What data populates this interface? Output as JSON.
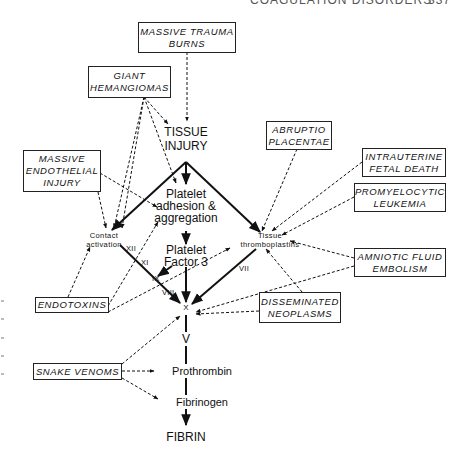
{
  "header": {
    "running_title": "COAGULATION DISORDERS",
    "page_number": "337"
  },
  "diagram": {
    "causes": [
      {
        "id": "trauma",
        "lines": [
          "MASSIVE TRAUMA",
          "BURNS"
        ],
        "targets": [
          "tissue_injury"
        ]
      },
      {
        "id": "hemangiomas",
        "lines": [
          "GIANT",
          "HEMANGIOMAS"
        ],
        "targets": [
          "tissue_injury",
          "platelet_adhesion",
          "contact_activation"
        ]
      },
      {
        "id": "endothelial",
        "lines": [
          "MASSIVE",
          "ENDOTHELIAL",
          "INJURY"
        ],
        "targets": [
          "contact_activation",
          "platelet_adhesion"
        ]
      },
      {
        "id": "abruptio",
        "lines": [
          "ABRUPTIO",
          "PLACENTAE"
        ],
        "targets": [
          "tissue_thromboplastins"
        ]
      },
      {
        "id": "fetal_death",
        "lines": [
          "INTRAUTERINE",
          "FETAL DEATH"
        ],
        "targets": [
          "tissue_thromboplastins"
        ]
      },
      {
        "id": "leukemia",
        "lines": [
          "PROMYELOCYTIC",
          "LEUKEMIA"
        ],
        "targets": [
          "tissue_thromboplastins"
        ]
      },
      {
        "id": "amniotic",
        "lines": [
          "AMNIOTIC FLUID",
          "EMBOLISM"
        ],
        "targets": [
          "tissue_thromboplastins",
          "factor_x"
        ]
      },
      {
        "id": "endotoxins",
        "lines": [
          "ENDOTOXINS"
        ],
        "targets": [
          "contact_activation",
          "platelet_adhesion",
          "tissue_thromboplastins"
        ]
      },
      {
        "id": "neoplasms",
        "lines": [
          "DISSEMINATED",
          "NEOPLASMS"
        ],
        "targets": [
          "tissue_thromboplastins",
          "factor_x"
        ]
      },
      {
        "id": "snake",
        "lines": [
          "SNAKE VENOMS"
        ],
        "targets": [
          "factor_x",
          "prothrombin",
          "fibrinogen"
        ]
      }
    ],
    "nodes": {
      "tissue_injury": [
        "TISSUE",
        "INJURY"
      ],
      "platelet_adhesion": [
        "Platelet",
        "adhesion &",
        "aggregation"
      ],
      "contact_activation": [
        "Contact",
        "activation"
      ],
      "tissue_thromboplastins": [
        "Tissue",
        "thromboplastins"
      ],
      "platelet_factor_3": [
        "Platelet",
        "Factor 3"
      ],
      "factor_x": "X",
      "factor_v": "V",
      "prothrombin": "Prothrombin",
      "fibrinogen": "Fibrinogen",
      "fibrin": "FIBRIN"
    },
    "factors": {
      "xii": "XII",
      "xi": "XI",
      "ix": "IX",
      "viii": "VIII",
      "vii": "VII"
    },
    "legend": {
      "solid_arrow": "coagulation pathway",
      "dashed_arrow": "trigger"
    }
  }
}
